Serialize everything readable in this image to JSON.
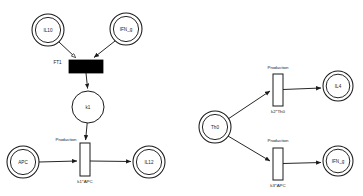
{
  "diagram": {
    "background_color": "#ffffff",
    "stroke_color": "#1a1a1a",
    "transition_fill_inhibited": "#000000",
    "transition_fill_open": "#ffffff"
  },
  "left_network": {
    "places": [
      {
        "id": "il10",
        "label": "IL10",
        "shape": "double-circle",
        "cx": 48,
        "cy": 30,
        "r": 16
      },
      {
        "id": "ifng",
        "label": "IFN_g",
        "shape": "double-circle",
        "cx": 126,
        "cy": 29,
        "r": 16
      },
      {
        "id": "k1p",
        "label": "k1",
        "shape": "circle",
        "cx": 88,
        "cy": 107,
        "r": 16
      },
      {
        "id": "apc",
        "label": "APC",
        "shape": "double-circle",
        "cx": 23,
        "cy": 162,
        "r": 16
      },
      {
        "id": "il12",
        "label": "IL12",
        "shape": "double-circle",
        "cx": 149,
        "cy": 162,
        "r": 16
      }
    ],
    "transitions": [
      {
        "id": "ft1",
        "label": "FT1",
        "side_label": "FT1",
        "style": "filled",
        "x": 69,
        "y": 60,
        "w": 34,
        "h": 13
      },
      {
        "id": "prod1",
        "label": "Production",
        "rate": "k1*APC",
        "style": "open",
        "x": 80,
        "y": 143,
        "w": 10,
        "h": 33
      }
    ],
    "labels": {
      "ft1_name": "FT1",
      "production": "Production",
      "rate": "k1*APC"
    },
    "arcs": [
      {
        "from": "il10",
        "to": "ft1",
        "head": "inhibit"
      },
      {
        "from": "ifng",
        "to": "ft1",
        "head": "arrow"
      },
      {
        "from": "ft1",
        "to": "k1p",
        "head": "arrow"
      },
      {
        "from": "k1p",
        "to": "prod1",
        "head": "arrow"
      },
      {
        "from": "apc",
        "to": "prod1",
        "head": "arrow"
      },
      {
        "from": "prod1",
        "to": "il12",
        "head": "arrow"
      }
    ]
  },
  "right_network": {
    "places": [
      {
        "id": "th0",
        "label": "Th0",
        "shape": "double-circle",
        "cx": 215,
        "cy": 127,
        "r": 16
      },
      {
        "id": "il4",
        "label": "IL4",
        "shape": "double-circle",
        "cx": 338,
        "cy": 86,
        "r": 15
      },
      {
        "id": "ifng2",
        "label": "IFN_g",
        "shape": "double-circle",
        "cx": 338,
        "cy": 161,
        "r": 15
      }
    ],
    "transitions": [
      {
        "id": "prod2",
        "label": "Production",
        "rate": "k2*Th0",
        "style": "open",
        "x": 273,
        "y": 74,
        "w": 10,
        "h": 32
      },
      {
        "id": "prod3",
        "label": "Production",
        "rate": "k3*APC",
        "style": "open",
        "x": 273,
        "y": 148,
        "w": 10,
        "h": 32
      }
    ],
    "labels": {
      "production_top": "Production",
      "rate_top": "k2*Th0",
      "production_bottom": "Production",
      "rate_bottom": "k3*APC"
    },
    "arcs": [
      {
        "from": "th0",
        "to": "prod2",
        "head": "arrow"
      },
      {
        "from": "prod2",
        "to": "il4",
        "head": "arrow"
      },
      {
        "from": "th0",
        "to": "prod3",
        "head": "arrow"
      },
      {
        "from": "prod3",
        "to": "ifng2",
        "head": "arrow"
      }
    ]
  }
}
